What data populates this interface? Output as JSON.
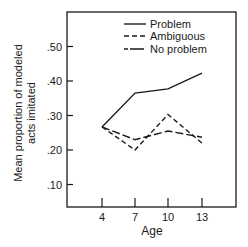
{
  "chart_data": {
    "type": "line",
    "title": "",
    "xlabel": "Age",
    "ylabel": [
      "Mean proportion of modeled",
      "acts imitated"
    ],
    "x": [
      4,
      7,
      10,
      13
    ],
    "x_tick_labels": [
      "4",
      "7",
      "10",
      "13"
    ],
    "y_tick_labels": [
      ".10",
      ".20",
      ".30",
      ".40",
      ".50"
    ],
    "y_ticks": [
      0.1,
      0.2,
      0.3,
      0.4,
      0.5
    ],
    "ylim": [
      0.03,
      0.59
    ],
    "grid": false,
    "legend_position": "upper right (inside)",
    "series": [
      {
        "name": "Problem",
        "style": "solid",
        "values": [
          0.267,
          0.365,
          0.377,
          0.423
        ]
      },
      {
        "name": "Ambiguous",
        "style": "short-dash",
        "values": [
          0.267,
          0.2,
          0.303,
          0.22
        ]
      },
      {
        "name": "No problem",
        "style": "long-dash",
        "values": [
          0.267,
          0.23,
          0.255,
          0.237
        ]
      }
    ]
  },
  "colors": {
    "ink": "#1a1a1a",
    "background": "#ffffff"
  }
}
